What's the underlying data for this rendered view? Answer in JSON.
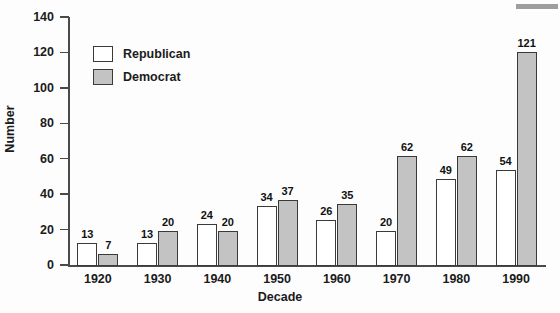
{
  "chart_data": {
    "type": "bar",
    "title": "",
    "xlabel": "Decade",
    "ylabel": "Number",
    "categories": [
      "1920",
      "1930",
      "1940",
      "1950",
      "1960",
      "1970",
      "1980",
      "1990"
    ],
    "series": [
      {
        "name": "Republican",
        "color": "#ffffff",
        "values": [
          13,
          13,
          24,
          34,
          26,
          20,
          49,
          54
        ]
      },
      {
        "name": "Democrat",
        "color": "#c3c3c3",
        "values": [
          7,
          20,
          20,
          37,
          35,
          62,
          62,
          121
        ]
      }
    ],
    "ylim": [
      0,
      140
    ],
    "yticks": [
      0,
      20,
      40,
      60,
      80,
      100,
      120,
      140
    ],
    "ytick_labels": [
      "0",
      "20",
      "40",
      "60",
      "80",
      "100",
      "120",
      "140"
    ],
    "grid": false,
    "legend_position": "top-left",
    "data_labels": true
  },
  "legend": {
    "items": [
      {
        "label": "Republican",
        "swatch": "republican-swatch"
      },
      {
        "label": "Democrat",
        "swatch": "democrat-swatch"
      }
    ]
  },
  "axes": {
    "y_title": "Number",
    "x_title": "Decade"
  }
}
